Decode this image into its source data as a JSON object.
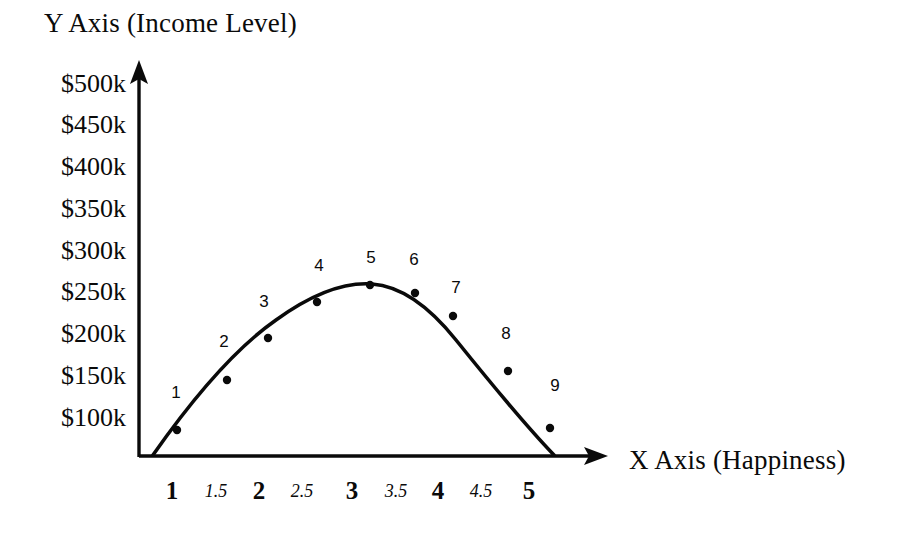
{
  "chart_data": {
    "type": "scatter",
    "title": "",
    "xlabel": "X Axis (Happiness)",
    "ylabel": "Y Axis (Income Level)",
    "grid": false,
    "legend": false,
    "xlim": [
      0.75,
      5.45
    ],
    "ylim": [
      0,
      530
    ],
    "y_unit": "k",
    "y_prefix": "$",
    "x_tick_labels": [
      "1",
      "1.5",
      "2",
      "2.5",
      "3",
      "3.5",
      "4",
      "4.5",
      "5"
    ],
    "x_tick_values": [
      1,
      1.5,
      2,
      2.5,
      3,
      3.5,
      4,
      4.5,
      5
    ],
    "x_tick_styles": [
      "major",
      "minor",
      "major",
      "minor",
      "major",
      "minor",
      "major",
      "minor",
      "major"
    ],
    "y_tick_labels": [
      "$500k",
      "$450k",
      "$400k",
      "$350k",
      "$300k",
      "$250k",
      "$200k",
      "$150k",
      "$100k"
    ],
    "y_tick_values": [
      500,
      450,
      400,
      350,
      300,
      250,
      200,
      150,
      100
    ],
    "point_labels": [
      "1",
      "2",
      "3",
      "4",
      "5",
      "6",
      "7",
      "8",
      "9"
    ],
    "x": [
      1.05,
      1.62,
      2.07,
      2.65,
      3.19,
      3.72,
      4.17,
      4.72,
      5.18
    ],
    "values": [
      90,
      148,
      195,
      237,
      257,
      243,
      222,
      157,
      88
    ],
    "series": [
      {
        "name": "Income Level",
        "values": [
          90,
          148,
          195,
          237,
          257,
          243,
          222,
          157,
          88
        ]
      }
    ]
  },
  "axes": {
    "y_title": "Y Axis (Income Level)",
    "x_title": "X Axis (Happiness)",
    "y_ticks": [
      {
        "label": "$500k",
        "y": 84
      },
      {
        "label": "$450k",
        "y": 125
      },
      {
        "label": "$400k",
        "y": 167
      },
      {
        "label": "$350k",
        "y": 209
      },
      {
        "label": "$300k",
        "y": 251
      },
      {
        "label": "$250k",
        "y": 292
      },
      {
        "label": "$200k",
        "y": 334
      },
      {
        "label": "$150k",
        "y": 376
      },
      {
        "label": "$100k",
        "y": 418
      }
    ],
    "x_ticks": [
      {
        "label": "1",
        "x": 172,
        "style": "major"
      },
      {
        "label": "1.5",
        "x": 216,
        "style": "minor"
      },
      {
        "label": "2",
        "x": 259,
        "style": "major"
      },
      {
        "label": "2.5",
        "x": 302,
        "style": "minor"
      },
      {
        "label": "3",
        "x": 352,
        "style": "major"
      },
      {
        "label": "3.5",
        "x": 396,
        "style": "minor"
      },
      {
        "label": "4",
        "x": 438,
        "style": "major"
      },
      {
        "label": "4.5",
        "x": 481,
        "style": "minor"
      },
      {
        "label": "5",
        "x": 529,
        "style": "major"
      }
    ]
  },
  "points": [
    {
      "label": "1",
      "cx": 177,
      "cy": 430,
      "lx": 176,
      "ly": 392
    },
    {
      "label": "2",
      "cx": 227,
      "cy": 380,
      "lx": 224,
      "ly": 341
    },
    {
      "label": "3",
      "cx": 268,
      "cy": 338,
      "lx": 264,
      "ly": 301
    },
    {
      "label": "4",
      "cx": 317,
      "cy": 302,
      "lx": 319,
      "ly": 265
    },
    {
      "label": "5",
      "cx": 370,
      "cy": 285,
      "lx": 371,
      "ly": 257
    },
    {
      "label": "6",
      "cx": 415,
      "cy": 293,
      "lx": 414,
      "ly": 259
    },
    {
      "label": "7",
      "cx": 453,
      "cy": 316,
      "lx": 456,
      "ly": 287
    },
    {
      "label": "8",
      "cx": 508,
      "cy": 371,
      "lx": 506,
      "ly": 333
    },
    {
      "label": "9",
      "cx": 550,
      "cy": 428,
      "lx": 555,
      "ly": 385
    }
  ],
  "style": {
    "ink": "#0a0a0a",
    "background": "#ffffff",
    "curve_width": 3.6,
    "axis_width": 3.4,
    "point_radius": 4.2
  }
}
